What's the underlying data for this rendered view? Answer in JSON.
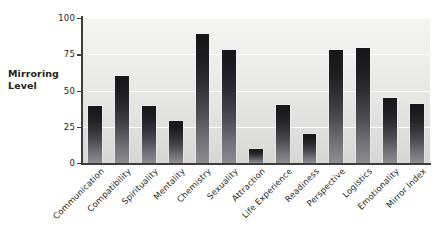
{
  "chart_data": {
    "type": "bar",
    "title": "",
    "subtitle": "",
    "xlabel": "",
    "ylabel": "Mirroring Level",
    "ylim": [
      0,
      100
    ],
    "yticks": [
      0,
      25,
      50,
      75,
      100
    ],
    "ytick_labels": [
      "0",
      "25",
      "50",
      "75",
      "100"
    ],
    "grid": "horizontal",
    "legend": "none",
    "bar_color": "#1d1d21",
    "plot_background": "#e9e9e6",
    "categories": [
      "Communication",
      "Compatibility",
      "Spirituality",
      "Mentality",
      "Chemistry",
      "Sexuality",
      "Attraction",
      "Life Experience",
      "Readiness",
      "Perspective",
      "Logistics",
      "Emotionality",
      "Mirror Index"
    ],
    "values": [
      39,
      60,
      39,
      29,
      89,
      78,
      10,
      40,
      20,
      78,
      79,
      45,
      41
    ]
  },
  "axis": {
    "y_title_line1": "Mirroring",
    "y_title_line2": "Level"
  }
}
